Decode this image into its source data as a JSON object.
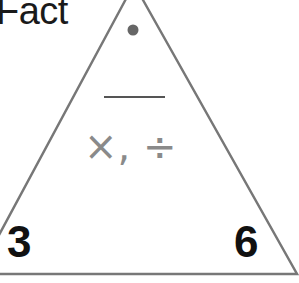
{
  "worksheet": {
    "title": "Fact",
    "triangle": {
      "top_slot": "",
      "operations": "×, ÷",
      "bottom_left_number": "3",
      "bottom_right_number": "6"
    },
    "colors": {
      "outline": "#777777",
      "dot": "#666666",
      "bar": "#555555",
      "operations_text": "#8a8a8a",
      "numbers": "#111111"
    }
  }
}
